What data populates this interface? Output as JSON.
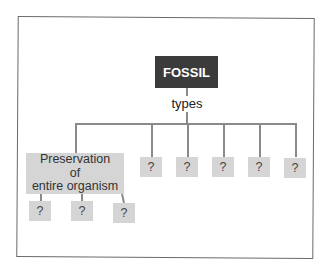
{
  "diagram": {
    "root": {
      "label": "FOSSIL",
      "fill": "#3b3b3b",
      "text_color": "#ffffff"
    },
    "connector_label": "types",
    "type_nodes": [
      {
        "label": "Preservation of entire organism",
        "lines": [
          "Preservation",
          "of",
          "entire organism"
        ],
        "children": [
          {
            "label": "?"
          },
          {
            "label": "?"
          },
          {
            "label": "?"
          }
        ]
      },
      {
        "label": "?"
      },
      {
        "label": "?"
      },
      {
        "label": "?"
      },
      {
        "label": "?"
      },
      {
        "label": "?"
      }
    ],
    "box_fill": "#d5d5d5",
    "line_color": "#8a8a8a"
  }
}
